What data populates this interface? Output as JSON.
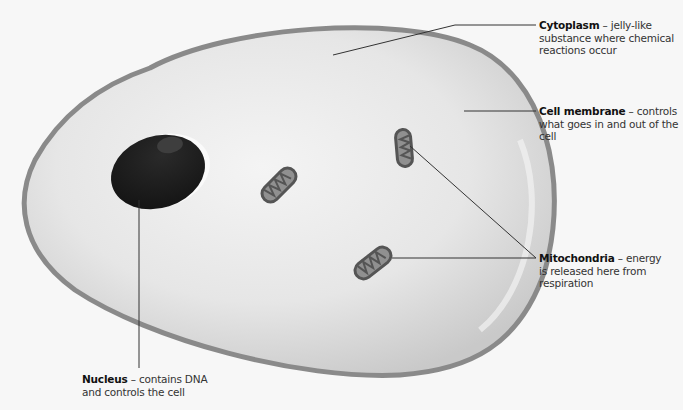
{
  "diagram": {
    "colors": {
      "background": "#f7f7f7",
      "membrane": "#8a8a8a",
      "cytoplasm": "#e2e2e2",
      "nucleus": "#1e1e1e",
      "nucleolus": "#3c3c3c",
      "mitochondrion_outer": "#555555",
      "mitochondrion_inner": "#8e8e8e",
      "leader_line": "#333333"
    },
    "labels": [
      {
        "id": "cytoplasm",
        "term": "Cytoplasm",
        "separator": " – ",
        "description": "jelly-like substance where chemical reactions occur"
      },
      {
        "id": "cell-membrane",
        "term": "Cell membrane",
        "separator": " – ",
        "description": "controls what goes in and out of the cell"
      },
      {
        "id": "mitochondria",
        "term": "Mitochondria",
        "separator": " – ",
        "description": "energy is released here from respiration"
      },
      {
        "id": "nucleus",
        "term": "Nucleus",
        "separator": " – ",
        "description": "contains DNA and controls the cell"
      }
    ]
  }
}
